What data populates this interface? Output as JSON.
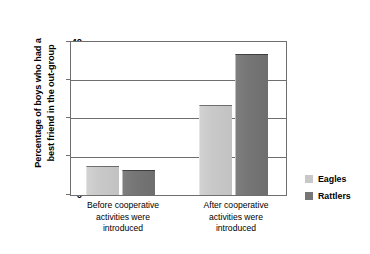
{
  "chart_data": {
    "type": "bar",
    "title": "",
    "subtitle": "",
    "xlabel": "",
    "ylabel": "Percentage of boys who had a best friend in the out-group",
    "ylabel_lines": [
      "Percentage of boys who had a",
      "best friend in the out-group"
    ],
    "ylim": [
      0,
      40
    ],
    "yticks": [
      0,
      10,
      20,
      30,
      40
    ],
    "ytick_labels": [
      "0",
      "10",
      "20",
      "30",
      "40"
    ],
    "grid": true,
    "grid_axis": "y",
    "legend_position": "right",
    "categories": [
      "Before cooperative activities were introduced",
      "After cooperative activities were introduced"
    ],
    "category_lines": [
      [
        "Before cooperative",
        "activities were",
        "introduced"
      ],
      [
        "After cooperative",
        "activities were",
        "introduced"
      ]
    ],
    "series": [
      {
        "name": "Eagles",
        "color": "#c8c8c8",
        "values": [
          7.7,
          23.5
        ]
      },
      {
        "name": "Rattlers",
        "color": "#767676",
        "values": [
          6.5,
          36.8
        ]
      }
    ],
    "annotations": []
  },
  "legend": {
    "items": [
      {
        "label": "Eagles",
        "color": "#c8c8c8"
      },
      {
        "label": "Rattlers",
        "color": "#767676"
      }
    ]
  },
  "style": {
    "axis_color": "#6f6f6f",
    "text_color": "#000000",
    "background": "#ffffff"
  }
}
